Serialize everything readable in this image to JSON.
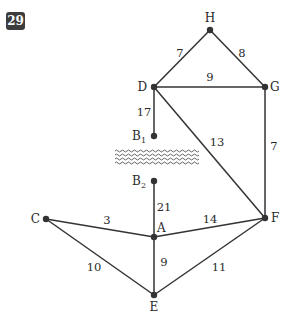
{
  "problem_number": "29",
  "colors": {
    "edge": "#333333",
    "node": "#333333",
    "badge_bg": "#3d3d3d",
    "water": "#555555"
  },
  "nodes": [
    {
      "id": "H",
      "label": "H",
      "x": 210,
      "y": 30,
      "lx": 210,
      "ly": 22,
      "anchor": "middle"
    },
    {
      "id": "D",
      "label": "D",
      "x": 154,
      "y": 87,
      "lx": 147,
      "ly": 91,
      "anchor": "end"
    },
    {
      "id": "G",
      "label": "G",
      "x": 265,
      "y": 87,
      "lx": 270,
      "ly": 91,
      "anchor": "start"
    },
    {
      "id": "B1",
      "label": "B",
      "sub": "1",
      "x": 154,
      "y": 136,
      "lx": 146,
      "ly": 140,
      "anchor": "end"
    },
    {
      "id": "B2",
      "label": "B",
      "sub": "2",
      "x": 154,
      "y": 181,
      "lx": 146,
      "ly": 185,
      "anchor": "end"
    },
    {
      "id": "C",
      "label": "C",
      "x": 46,
      "y": 219,
      "lx": 40,
      "ly": 223,
      "anchor": "end"
    },
    {
      "id": "A",
      "label": "A",
      "x": 154,
      "y": 237,
      "lx": 157,
      "ly": 232,
      "anchor": "start"
    },
    {
      "id": "F",
      "label": "F",
      "x": 265,
      "y": 218,
      "lx": 271,
      "ly": 222,
      "anchor": "start"
    },
    {
      "id": "E",
      "label": "E",
      "x": 154,
      "y": 295,
      "lx": 154,
      "ly": 311,
      "anchor": "middle"
    }
  ],
  "edges": [
    {
      "from": "H",
      "to": "D",
      "weight": "7",
      "wx": 180,
      "wy": 57
    },
    {
      "from": "H",
      "to": "G",
      "weight": "8",
      "wx": 242,
      "wy": 57
    },
    {
      "from": "D",
      "to": "G",
      "weight": "9",
      "wx": 210,
      "wy": 81
    },
    {
      "from": "D",
      "to": "B1",
      "weight": "17",
      "wx": 144,
      "wy": 116
    },
    {
      "from": "D",
      "to": "F",
      "weight": "13",
      "wx": 217,
      "wy": 146
    },
    {
      "from": "G",
      "to": "F",
      "weight": "7",
      "wx": 274,
      "wy": 150
    },
    {
      "from": "B2",
      "to": "A",
      "weight": "21",
      "wx": 164,
      "wy": 211
    },
    {
      "from": "C",
      "to": "A",
      "weight": "3",
      "wx": 107,
      "wy": 224
    },
    {
      "from": "A",
      "to": "F",
      "weight": "14",
      "wx": 210,
      "wy": 223
    },
    {
      "from": "C",
      "to": "E",
      "weight": "10",
      "wx": 94,
      "wy": 271
    },
    {
      "from": "A",
      "to": "E",
      "weight": "9",
      "wx": 164,
      "wy": 266
    },
    {
      "from": "E",
      "to": "F",
      "weight": "11",
      "wx": 219,
      "wy": 271
    }
  ],
  "river": {
    "x1": 115,
    "x2": 197,
    "ys": [
      151,
      155,
      159,
      163
    ]
  }
}
